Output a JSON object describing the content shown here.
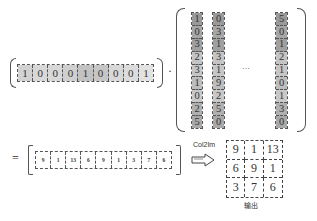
{
  "kernel_row": {
    "values": [
      "1",
      "0",
      "0",
      "0",
      "1",
      "0",
      "0",
      "0",
      "1"
    ],
    "shades": [
      "#d2d2d2",
      "#d8d8d8",
      "#d8d8d8",
      "#cfcfcf",
      "#c2c2c2",
      "#c6c6c6",
      "#d8d8d8",
      "#dcdcdc",
      "#e2e2e2"
    ]
  },
  "operator_dot": "·",
  "columns": [
    {
      "values": [
        "1",
        "0",
        "3",
        "2",
        "3",
        "1",
        "0",
        "2",
        "5"
      ]
    },
    {
      "values": [
        "0",
        "3",
        "1",
        "3",
        "1",
        "9",
        "2",
        "5",
        "0"
      ]
    },
    {
      "values": [
        "5",
        "0",
        "1",
        "2",
        "1",
        "0",
        "1",
        "3",
        "0"
      ]
    }
  ],
  "column_shades": [
    "#9a9a9a",
    "#a6a6a6",
    "#a0a0a0",
    "#c4c4c4",
    "#c6c6c6",
    "#bdbdbd",
    "#c8c8c8",
    "#b0b0b0",
    "#a8a8a8"
  ],
  "ellipsis": "···",
  "equals": "=",
  "result_row": {
    "values": [
      "9",
      "1",
      "13",
      "6",
      "9",
      "1",
      "3",
      "7",
      "6"
    ]
  },
  "arrow_label": "Col2Im",
  "output_grid": {
    "values": [
      "9",
      "1",
      "13",
      "6",
      "9",
      "1",
      "3",
      "7",
      "6"
    ]
  },
  "output_label": "输出"
}
